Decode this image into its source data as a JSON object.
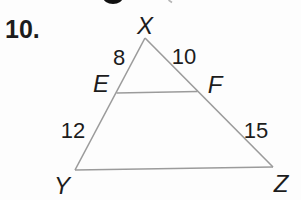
{
  "problem": {
    "number": "10."
  },
  "figure": {
    "vertices": {
      "top": "X",
      "bottom_left": "Y",
      "bottom_right": "Z"
    },
    "midpoints": {
      "left": "E",
      "right": "F"
    },
    "lengths": {
      "xe": "8",
      "xf": "10",
      "ey": "12",
      "fz": "15"
    }
  },
  "colors": {
    "line": "#9b9b9b",
    "text": "#1c1c1c",
    "artifact": "#111111",
    "artifact_light": "#b5b5b5"
  }
}
